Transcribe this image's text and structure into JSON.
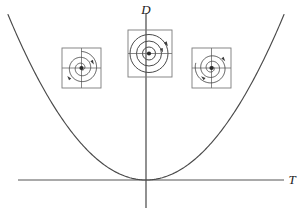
{
  "figure": {
    "title": "",
    "axes": {
      "vertical_label": "D",
      "horizontal_label": "T",
      "vertical_axis_x": 146,
      "horizontal_axis_y": 180
    },
    "curve": {
      "name": "discriminant-parabola",
      "equation": "D = T^2 / 4",
      "color": "#4a4a4a",
      "vertex": "origin"
    },
    "insets": [
      {
        "id": "left",
        "name": "stable-spiral",
        "label": "",
        "box": {
          "x": 62,
          "y": 48,
          "w": 39,
          "h": 40
        },
        "portrait_type": "spiral",
        "direction": "inward",
        "rotation": "counterclockwise",
        "fixed_point": "filled-dot"
      },
      {
        "id": "center",
        "name": "center-closed-orbits",
        "label": "",
        "box": {
          "x": 128,
          "y": 30,
          "w": 44,
          "h": 47
        },
        "portrait_type": "center",
        "direction": "closed",
        "rotation": "counterclockwise",
        "fixed_point": "filled-dot"
      },
      {
        "id": "right",
        "name": "unstable-spiral",
        "label": "",
        "box": {
          "x": 192,
          "y": 48,
          "w": 39,
          "h": 40
        },
        "portrait_type": "spiral",
        "direction": "outward",
        "rotation": "counterclockwise",
        "fixed_point": "filled-dot"
      }
    ],
    "colors": {
      "stroke": "#4a4a4a",
      "axis": "#555555",
      "ink": "#1a1a1a",
      "background": "#ffffff"
    }
  },
  "chart_data": {
    "type": "line",
    "title": "",
    "xlabel": "T",
    "ylabel": "D",
    "grid": false,
    "legend": "none",
    "xlim": [
      -6.8,
      6.8
    ],
    "ylim": [
      -0.9,
      11.6
    ],
    "series": [
      {
        "name": "D = T^2/4",
        "x": [
          -6.8,
          -6.0,
          -5.0,
          -4.0,
          -3.0,
          -2.0,
          -1.0,
          0.0,
          1.0,
          2.0,
          3.0,
          4.0,
          5.0,
          6.0,
          6.8
        ],
        "y": [
          11.56,
          9.0,
          6.25,
          4.0,
          2.25,
          1.0,
          0.25,
          0.0,
          0.25,
          1.0,
          2.25,
          4.0,
          6.25,
          9.0,
          11.56
        ]
      }
    ],
    "annotations": [
      {
        "text": "stable spiral",
        "x": -3.6,
        "y": 7.2,
        "glyph": "inward-spiral-inset"
      },
      {
        "text": "center",
        "x": 0.0,
        "y": 8.6,
        "glyph": "closed-orbit-inset"
      },
      {
        "text": "unstable spiral",
        "x": 3.6,
        "y": 7.2,
        "glyph": "outward-spiral-inset"
      }
    ]
  }
}
